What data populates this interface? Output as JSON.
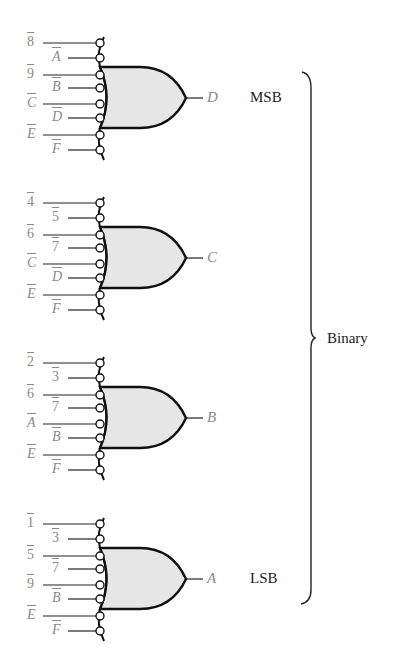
{
  "diagram": {
    "colors": {
      "wire": "#222222",
      "gate_fill": "#e6e6e6",
      "gate_stroke": "#111111",
      "input_label": "#8a8a8a",
      "side_label": "#222222"
    },
    "gates": [
      {
        "output": "D",
        "side_label": "MSB",
        "inputs": [
          {
            "label": "8",
            "italic": false
          },
          {
            "label": "A",
            "italic": true
          },
          {
            "label": "9",
            "italic": false
          },
          {
            "label": "B",
            "italic": true
          },
          {
            "label": "C",
            "italic": true
          },
          {
            "label": "D",
            "italic": true
          },
          {
            "label": "E",
            "italic": true
          },
          {
            "label": "F",
            "italic": true
          }
        ]
      },
      {
        "output": "C",
        "side_label": "",
        "inputs": [
          {
            "label": "4",
            "italic": false
          },
          {
            "label": "5",
            "italic": false
          },
          {
            "label": "6",
            "italic": false
          },
          {
            "label": "7",
            "italic": false
          },
          {
            "label": "C",
            "italic": true
          },
          {
            "label": "D",
            "italic": true
          },
          {
            "label": "E",
            "italic": true
          },
          {
            "label": "F",
            "italic": true
          }
        ]
      },
      {
        "output": "B",
        "side_label": "",
        "inputs": [
          {
            "label": "2",
            "italic": false
          },
          {
            "label": "3",
            "italic": false
          },
          {
            "label": "6",
            "italic": false
          },
          {
            "label": "7",
            "italic": false
          },
          {
            "label": "A",
            "italic": true
          },
          {
            "label": "B",
            "italic": true
          },
          {
            "label": "E",
            "italic": true
          },
          {
            "label": "F",
            "italic": true
          }
        ]
      },
      {
        "output": "A",
        "side_label": "LSB",
        "inputs": [
          {
            "label": "1",
            "italic": false
          },
          {
            "label": "3",
            "italic": false
          },
          {
            "label": "5",
            "italic": false
          },
          {
            "label": "7",
            "italic": false
          },
          {
            "label": "9",
            "italic": false
          },
          {
            "label": "B",
            "italic": true
          },
          {
            "label": "E",
            "italic": true
          },
          {
            "label": "F",
            "italic": true
          }
        ]
      }
    ],
    "brace_label": "Binary"
  }
}
